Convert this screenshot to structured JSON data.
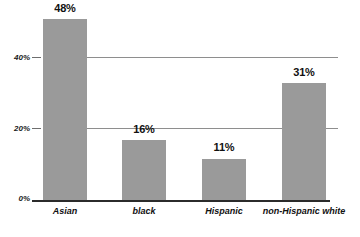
{
  "chart_data": {
    "type": "bar",
    "title": "",
    "subtitle": "",
    "xlabel": "",
    "ylabel": "",
    "categories": [
      "Asian",
      "black",
      "Hispanic",
      "non-Hispanic white"
    ],
    "values": [
      48,
      16,
      11,
      31
    ],
    "value_labels": [
      "48%",
      "16%",
      "11%",
      "31%"
    ],
    "ylim": [
      0,
      53
    ],
    "yticks": [
      0,
      20,
      40
    ],
    "ytick_labels": [
      "0%",
      "20%",
      "40%"
    ],
    "grid": "horizontal",
    "gridlines_at": [
      20,
      40
    ],
    "legend": "none",
    "series": [
      {
        "name": "",
        "values": [
          48,
          16,
          11,
          31
        ]
      }
    ],
    "colors": {
      "bar_fill": "#9a9a9a",
      "gridline": "#8e8e8e",
      "axis": "#2b2b2b",
      "text": "#111111",
      "background": "#ffffff"
    }
  }
}
